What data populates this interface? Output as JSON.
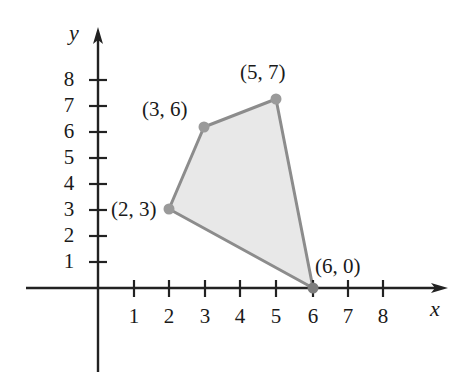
{
  "figure": {
    "type": "coordinate-plane-polygon",
    "background_color": "#ffffff"
  },
  "axes": {
    "x_axis_name": "x",
    "y_axis_name": "y",
    "axis_color": "#222222",
    "origin_px": {
      "x": 98,
      "y": 288
    },
    "unit_px": {
      "x": 35.5,
      "y": 26
    },
    "x_ticks": [
      "1",
      "2",
      "3",
      "4",
      "5",
      "6",
      "7",
      "8"
    ],
    "y_ticks": [
      "1",
      "2",
      "3",
      "4",
      "5",
      "6",
      "7",
      "8"
    ],
    "x_tick_values": [
      1,
      2,
      3,
      4,
      5,
      6,
      7,
      8
    ],
    "y_tick_values": [
      1,
      2,
      3,
      4,
      5,
      6,
      7,
      8
    ],
    "x_arrow_tip_px": 443,
    "y_arrow_tip_px": 30
  },
  "chart_data": {
    "type": "scatter",
    "title": "",
    "xlabel": "x",
    "ylabel": "y",
    "xlim": [
      0,
      9
    ],
    "ylim": [
      0,
      9
    ],
    "grid": false,
    "legend": "none",
    "shape": "polygon",
    "fill_color": "#e8e8e8",
    "edge_color": "#808080",
    "vertex_color": "#9a9a9a",
    "vertices": [
      {
        "label": "(2, 3)",
        "x": 2,
        "y": 3,
        "px": 169,
        "py": 209,
        "label_px": 117,
        "label_py": 200,
        "label_anchor": "right"
      },
      {
        "label": "(3, 6)",
        "x": 3,
        "y": 6,
        "px": 204,
        "py": 127,
        "label_px": 146,
        "label_py": 100,
        "label_anchor": "right"
      },
      {
        "label": "(5, 7)",
        "x": 5,
        "y": 7,
        "px": 276,
        "py": 99,
        "label_px": 243,
        "label_py": 62,
        "label_anchor": "left"
      },
      {
        "label": "(6, 0)",
        "x": 6,
        "y": 0,
        "px": 313,
        "py": 288,
        "label_px": 317,
        "label_py": 258,
        "label_anchor": "left"
      }
    ],
    "polygon_points": "169,209 204,127 276,99 313,288"
  }
}
